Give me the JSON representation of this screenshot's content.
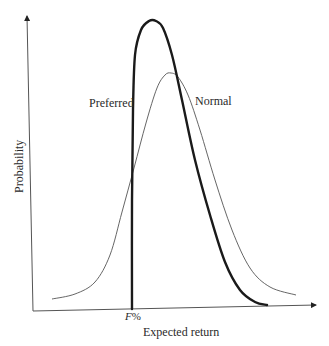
{
  "chart_data": {
    "type": "line",
    "title": "",
    "xlabel": "Expected return",
    "ylabel": "Probability",
    "x_tick_labels": [
      "F%"
    ],
    "grid": false,
    "legend": "inline labels on curves",
    "series": [
      {
        "name": "Preferred",
        "style": "thick",
        "description": "Truncated distribution: zero below F%, vertical rise at F%, peak higher and left of Normal, steeper right tail",
        "points": [
          [
            132,
            309
          ],
          [
            132,
            200
          ],
          [
            133,
            110
          ],
          [
            135,
            55
          ],
          [
            141,
            30
          ],
          [
            149,
            21
          ],
          [
            156,
            21
          ],
          [
            163,
            28
          ],
          [
            172,
            55
          ],
          [
            182,
            100
          ],
          [
            195,
            160
          ],
          [
            210,
            215
          ],
          [
            225,
            262
          ],
          [
            240,
            290
          ],
          [
            255,
            302
          ],
          [
            267,
            305
          ]
        ]
      },
      {
        "name": "Normal",
        "style": "thin",
        "description": "Symmetric bell curve, lower peak, wider spread",
        "points": [
          [
            52,
            299
          ],
          [
            75,
            294
          ],
          [
            95,
            282
          ],
          [
            110,
            255
          ],
          [
            122,
            212
          ],
          [
            134,
            168
          ],
          [
            146,
            123
          ],
          [
            157,
            88
          ],
          [
            165,
            75
          ],
          [
            171,
            73
          ],
          [
            178,
            77
          ],
          [
            188,
            95
          ],
          [
            200,
            130
          ],
          [
            215,
            180
          ],
          [
            232,
            230
          ],
          [
            250,
            268
          ],
          [
            270,
            287
          ],
          [
            296,
            295
          ]
        ]
      }
    ],
    "annotations": [
      {
        "text": "Preferred",
        "x": 89,
        "y": 107
      },
      {
        "text": "Normal",
        "x": 195,
        "y": 105
      },
      {
        "text": "F%",
        "x": 125,
        "y": 320
      }
    ]
  },
  "labels": {
    "preferred": "Preferred",
    "normal": "Normal",
    "f_tick": "F",
    "f_tick_suffix": "%",
    "xlabel": "Expected return",
    "ylabel": "Probability"
  }
}
